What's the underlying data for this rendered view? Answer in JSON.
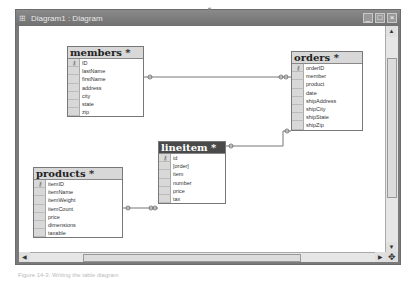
{
  "window": {
    "title": "Diagram1 : Diagram",
    "icon": "diagram-icon",
    "controls": [
      "minimize",
      "maximize",
      "close"
    ]
  },
  "tables": [
    {
      "name": "members *",
      "fields": [
        "ID",
        "lastName",
        "firstName",
        "address",
        "city",
        "state",
        "zip"
      ],
      "key_field": "ID",
      "selected": false
    },
    {
      "name": "orders *",
      "fields": [
        "orderID",
        "member",
        "product",
        "date",
        "shipAddress",
        "shipCity",
        "shipState",
        "shipZip"
      ],
      "key_field": "orderID",
      "selected": false
    },
    {
      "name": "products *",
      "fields": [
        "itemID",
        "itemName",
        "itemWeight",
        "itemCount",
        "price",
        "dimensions",
        "taxable"
      ],
      "key_field": "itemID",
      "selected": false
    },
    {
      "name": "lineitem *",
      "fields": [
        "id",
        "[order]",
        "item",
        "number",
        "price",
        "tax"
      ],
      "key_field": "id",
      "selected": true
    }
  ],
  "relationships": [
    {
      "from": "members",
      "to": "orders"
    },
    {
      "from": "orders",
      "to": "lineitem"
    },
    {
      "from": "products",
      "to": "lineitem"
    }
  ],
  "scrollbars": {
    "vertical": "visible",
    "horizontal": "visible"
  },
  "caption": "Figure 14-3: Writing the table diagram"
}
